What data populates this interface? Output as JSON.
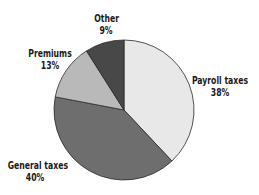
{
  "chart_data": {
    "type": "pie",
    "title": "",
    "categories": [
      "Payroll taxes",
      "General taxes",
      "Premiums",
      "Other"
    ],
    "values": [
      38,
      40,
      13,
      9
    ],
    "units": "%",
    "start_angle_deg": 0,
    "direction": "clockwise",
    "colors": [
      "#e8e8e8",
      "#6e6e6e",
      "#b9b9b9",
      "#484848"
    ],
    "labels": [
      {
        "name": "Payroll taxes",
        "pct": "38%"
      },
      {
        "name": "General taxes",
        "pct": "40%"
      },
      {
        "name": "Premiums",
        "pct": "13%"
      },
      {
        "name": "Other",
        "pct": "9%"
      }
    ],
    "legend": "none (direct labels)"
  }
}
